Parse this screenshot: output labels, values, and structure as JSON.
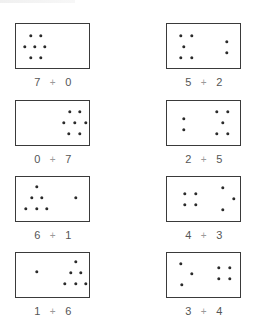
{
  "diagram": {
    "type": "dot-addition-cards",
    "operator_symbol": "+",
    "colors": {
      "box_border": "#3a3a3a",
      "dot": "#2b2b2b",
      "number_text": "#555555",
      "plus_text": "#9a9a9a"
    },
    "cards": [
      {
        "id": "7-plus-0",
        "left": 7,
        "right": 0,
        "pos": [
          15,
          23
        ],
        "dots": [
          [
            15,
            12
          ],
          [
            25,
            12
          ],
          [
            9,
            23
          ],
          [
            19,
            23
          ],
          [
            29,
            23
          ],
          [
            15,
            34
          ],
          [
            25,
            34
          ]
        ]
      },
      {
        "id": "5-plus-2",
        "left": 5,
        "right": 2,
        "pos": [
          166,
          23
        ],
        "dots": [
          [
            14,
            12
          ],
          [
            25,
            12
          ],
          [
            17,
            23
          ],
          [
            14,
            34
          ],
          [
            25,
            34
          ],
          [
            60,
            18
          ],
          [
            60,
            29
          ]
        ]
      },
      {
        "id": "0-plus-7",
        "left": 0,
        "right": 7,
        "pos": [
          15,
          100
        ],
        "dots": [
          [
            54,
            11
          ],
          [
            64,
            11
          ],
          [
            48,
            22
          ],
          [
            59,
            22
          ],
          [
            70,
            22
          ],
          [
            53,
            33
          ],
          [
            64,
            33
          ]
        ]
      },
      {
        "id": "2-plus-5",
        "left": 2,
        "right": 5,
        "pos": [
          166,
          100
        ],
        "dots": [
          [
            17,
            18
          ],
          [
            17,
            29
          ],
          [
            50,
            11
          ],
          [
            61,
            11
          ],
          [
            56,
            22
          ],
          [
            50,
            33
          ],
          [
            61,
            33
          ]
        ]
      },
      {
        "id": "6-plus-1",
        "left": 6,
        "right": 1,
        "pos": [
          15,
          176
        ],
        "dots": [
          [
            21,
            10
          ],
          [
            16,
            21
          ],
          [
            26,
            21
          ],
          [
            10,
            32
          ],
          [
            21,
            32
          ],
          [
            31,
            32
          ],
          [
            60,
            21
          ]
        ]
      },
      {
        "id": "4-plus-3",
        "left": 4,
        "right": 3,
        "pos": [
          166,
          176
        ],
        "dots": [
          [
            18,
            17
          ],
          [
            29,
            17
          ],
          [
            18,
            28
          ],
          [
            29,
            28
          ],
          [
            56,
            11
          ],
          [
            67,
            22
          ],
          [
            56,
            33
          ]
        ]
      },
      {
        "id": "1-plus-6",
        "left": 1,
        "right": 6,
        "pos": [
          15,
          252
        ],
        "dots": [
          [
            21,
            19
          ],
          [
            60,
            9
          ],
          [
            55,
            20
          ],
          [
            65,
            20
          ],
          [
            49,
            31
          ],
          [
            60,
            31
          ],
          [
            70,
            31
          ]
        ]
      },
      {
        "id": "3-plus-4",
        "left": 3,
        "right": 4,
        "pos": [
          166,
          252
        ],
        "dots": [
          [
            14,
            11
          ],
          [
            25,
            21
          ],
          [
            15,
            32
          ],
          [
            52,
            15
          ],
          [
            63,
            15
          ],
          [
            52,
            26
          ],
          [
            63,
            26
          ]
        ]
      }
    ]
  }
}
